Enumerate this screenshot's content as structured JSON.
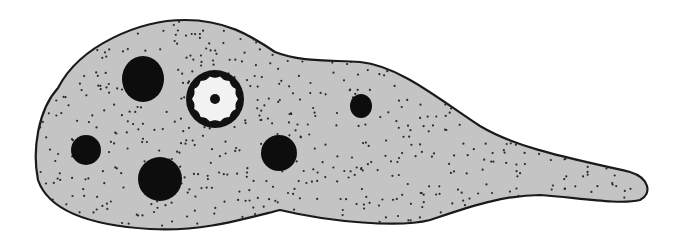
{
  "figure": {
    "width": 689,
    "height": 238,
    "colors": {
      "background": "#ffffff",
      "cytoplasm": "#c4c4c4",
      "outline": "#1a1a1a",
      "vacuole": "#0d0d0d",
      "nucleus_ring": "#111111",
      "nucleus_inner": "#f2f2f2",
      "granule": "#2a2a2a"
    },
    "cell_outline_path": "M 58 88 C 80 45, 140 20, 185 20 C 225 20, 250 35, 275 52 C 300 62, 330 60, 360 62 C 400 66, 440 100, 480 126 C 520 150, 580 160, 630 172 C 650 178, 652 194, 640 200 C 620 205, 580 198, 540 195 C 500 195, 460 210, 430 220 C 400 228, 330 222, 280 210 C 240 220, 200 232, 150 229 C 100 226, 50 215, 38 180 C 32 150, 38 110, 58 88 Z",
    "food_vacuoles": [
      {
        "cx": 143,
        "cy": 79,
        "rx": 21,
        "ry": 23
      },
      {
        "cx": 86,
        "cy": 150,
        "rx": 15,
        "ry": 15
      },
      {
        "cx": 160,
        "cy": 179,
        "rx": 22,
        "ry": 22
      },
      {
        "cx": 279,
        "cy": 153,
        "rx": 18,
        "ry": 18
      },
      {
        "cx": 361,
        "cy": 106,
        "rx": 11,
        "ry": 12
      }
    ],
    "nucleus": {
      "cx": 215,
      "cy": 99,
      "outer_r": 29,
      "inner_r": 23,
      "scallops": 14,
      "karyosome_r": 5
    }
  }
}
